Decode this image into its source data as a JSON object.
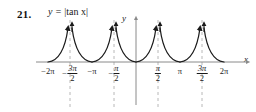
{
  "problem": {
    "number": "21."
  },
  "equation": {
    "lhs": "y",
    "eq": "=",
    "rhs": "|tan x|",
    "full": "y = |tan x|"
  },
  "axes": {
    "x_label": "x",
    "y_label": "y",
    "x_axis_color": "#8a8a8a",
    "y_axis_color": "#8a8a8a",
    "asymptote_color": "#b0b0b0",
    "curve_color": "#1a1a1a"
  },
  "ticks": [
    {
      "label": "-2π",
      "kind": "plain",
      "sign": "−",
      "num": "2π",
      "den": "",
      "x": 48
    },
    {
      "label": "-3π/2",
      "kind": "frac",
      "sign": "−",
      "num": "3π",
      "den": "2",
      "x": 70
    },
    {
      "label": "-π",
      "kind": "plain",
      "sign": "−",
      "num": "π",
      "den": "",
      "x": 92
    },
    {
      "label": "-π/2",
      "kind": "frac",
      "sign": "−",
      "num": "π",
      "den": "2",
      "x": 114
    },
    {
      "label": "π/2",
      "kind": "frac",
      "sign": "",
      "num": "π",
      "den": "2",
      "x": 158
    },
    {
      "label": "π",
      "kind": "plain",
      "sign": "",
      "num": "π",
      "den": "",
      "x": 180
    },
    {
      "label": "3π/2",
      "kind": "frac",
      "sign": "",
      "num": "3π",
      "den": "2",
      "x": 202
    },
    {
      "label": "2π",
      "kind": "plain",
      "sign": "",
      "num": "2π",
      "den": "",
      "x": 224
    }
  ],
  "chart_data": {
    "type": "line",
    "title": "y = |tan x|",
    "xlabel": "x",
    "ylabel": "y",
    "xlim": [
      -7.2,
      7.2
    ],
    "ylim": [
      0,
      3.2
    ],
    "grid": false,
    "legend": null,
    "function": "y = |tan(x)|",
    "x_tick_values": [
      -6.2832,
      -4.7124,
      -3.1416,
      -1.5708,
      1.5708,
      3.1416,
      4.7124,
      6.2832
    ],
    "x_tick_labels": [
      "-2π",
      "-3π/2",
      "-π",
      "-π/2",
      "π/2",
      "π",
      "3π/2",
      "2π"
    ],
    "zeros": [
      -6.2832,
      -3.1416,
      0,
      3.1416,
      6.2832
    ],
    "asymptotes": [
      -4.7124,
      -1.5708,
      1.5708,
      4.7124
    ],
    "asymptote_style": "dashed",
    "branches": [
      {
        "domain": [
          -6.2832,
          -4.7124
        ],
        "shape": "rises from 0 to +infinity"
      },
      {
        "domain": [
          -4.7124,
          -3.1416
        ],
        "shape": "falls from +infinity to 0"
      },
      {
        "domain": [
          -3.1416,
          -1.5708
        ],
        "shape": "rises from 0 to +infinity"
      },
      {
        "domain": [
          -1.5708,
          0
        ],
        "shape": "falls from +infinity to 0"
      },
      {
        "domain": [
          0,
          1.5708
        ],
        "shape": "rises from 0 to +infinity"
      },
      {
        "domain": [
          1.5708,
          3.1416
        ],
        "shape": "falls from +infinity to 0"
      },
      {
        "domain": [
          3.1416,
          4.7124
        ],
        "shape": "rises from 0 to +infinity"
      },
      {
        "domain": [
          4.7124,
          6.2832
        ],
        "shape": "falls from +infinity to 0"
      }
    ],
    "arrowheads": "on each branch end approaching an asymptote"
  }
}
